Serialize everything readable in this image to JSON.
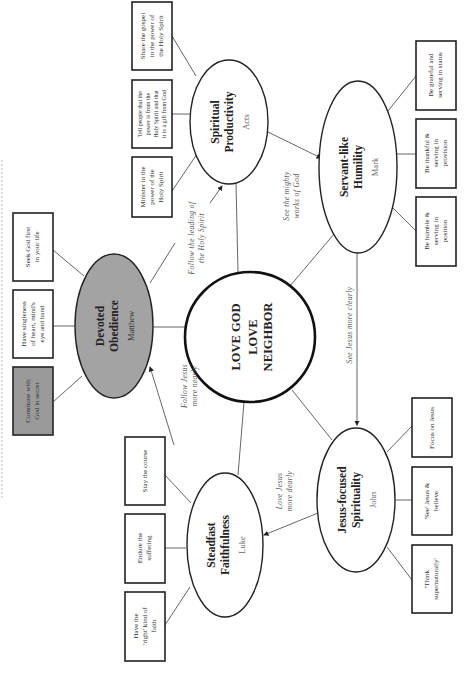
{
  "center": {
    "line1": "LOVE GOD",
    "line2": "LOVE",
    "line3": "NEIGHBOR"
  },
  "nodes": {
    "matthew": {
      "title1": "Devoted",
      "title2": "Obedience",
      "book": "Matthew",
      "fill": "#a3a3a3",
      "boxes": [
        {
          "lines": [
            "Seek God first",
            "in your life"
          ]
        },
        {
          "lines": [
            "Have singleness",
            "of heart, mind's",
            "eye and hand"
          ]
        },
        {
          "lines": [
            "Commune with",
            "God in secret"
          ],
          "highlighted": true
        }
      ]
    },
    "acts": {
      "title1": "Spiritual",
      "title2": "Productivity",
      "book": "Acts",
      "boxes": [
        {
          "lines": [
            "Minister in the",
            "power of the",
            "Holy Spirit"
          ]
        },
        {
          "lines": [
            "Tell people that the",
            "power is from the",
            "Holy Spirit and that",
            "it is a gift from God"
          ]
        },
        {
          "lines": [
            "Share the gospel",
            "in the power of",
            "the Holy Spirit"
          ]
        }
      ]
    },
    "mark": {
      "title1": "Servant-like",
      "title2": "Humility",
      "book": "Mark",
      "boxes": [
        {
          "lines": [
            "Be grateful and",
            "serving in status"
          ]
        },
        {
          "lines": [
            "Be thankful &",
            "serving in",
            "provision"
          ]
        },
        {
          "lines": [
            "Be humble &",
            "serving in",
            "position"
          ]
        }
      ]
    },
    "john": {
      "title1": "Jesus-focused",
      "title2": "Spirituality",
      "book": "John",
      "boxes": [
        {
          "lines": [
            "Focus on Jesus"
          ]
        },
        {
          "lines": [
            "'See' Jesus &",
            "believe"
          ]
        },
        {
          "lines": [
            "'Think",
            "supernaturally'"
          ]
        }
      ]
    },
    "luke": {
      "title1": "Steadfast",
      "title2": "Faithfulness",
      "book": "Luke",
      "boxes": [
        {
          "lines": [
            "Stay the course"
          ]
        },
        {
          "lines": [
            "Endure the",
            "suffering"
          ]
        },
        {
          "lines": [
            "Have the",
            "'right' kind of",
            "faith"
          ]
        }
      ]
    }
  },
  "edge_labels": {
    "matthew_to_acts": [
      "Follow the leading of",
      "the Holy Spirit"
    ],
    "acts_to_mark": [
      "See the mighty",
      "works of God"
    ],
    "mark_to_john": [
      "See Jesus more clearly"
    ],
    "john_to_luke": [
      "Love Jesus",
      "more dearly"
    ],
    "luke_to_matthew": [
      "Follow Jesus",
      "more nearly"
    ]
  }
}
